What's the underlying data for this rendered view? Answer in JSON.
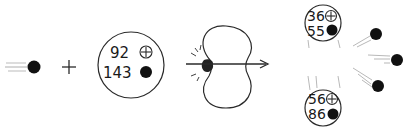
{
  "diagram": {
    "type": "nuclear-fission",
    "operator": "+",
    "incoming_neutron": {
      "label": "neutron"
    },
    "target_nucleus": {
      "protons": "92",
      "neutrons": "143"
    },
    "deformed_nucleus": {
      "label": "compound nucleus"
    },
    "fragments": [
      {
        "protons": "36",
        "neutrons": "55"
      },
      {
        "protons": "56",
        "neutrons": "86"
      }
    ],
    "released_neutrons": 3
  }
}
